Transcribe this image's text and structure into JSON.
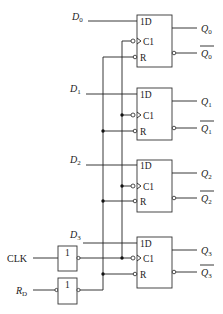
{
  "diagram": {
    "type": "circuit",
    "flipflops": [
      {
        "id": "FF0",
        "d_label": "D",
        "d_sub": "0",
        "q_label": "Q",
        "q_sub": "0",
        "qn_label": "Q",
        "qn_sub": "0",
        "pins": {
          "d": "1D",
          "clk": "C1",
          "reset": "R"
        }
      },
      {
        "id": "FF1",
        "d_label": "D",
        "d_sub": "1",
        "q_label": "Q",
        "q_sub": "1",
        "qn_label": "Q",
        "qn_sub": "1",
        "pins": {
          "d": "1D",
          "clk": "C1",
          "reset": "R"
        }
      },
      {
        "id": "FF2",
        "d_label": "D",
        "d_sub": "2",
        "q_label": "Q",
        "q_sub": "2",
        "qn_label": "Q",
        "qn_sub": "2",
        "pins": {
          "d": "1D",
          "clk": "C1",
          "reset": "R"
        }
      },
      {
        "id": "FF3",
        "d_label": "D",
        "d_sub": "3",
        "q_label": "Q",
        "q_sub": "3",
        "qn_label": "Q",
        "qn_sub": "3",
        "pins": {
          "d": "1D",
          "clk": "C1",
          "reset": "R"
        }
      }
    ],
    "gates": [
      {
        "id": "clk-inverter",
        "label": "1",
        "input": "CLK"
      },
      {
        "id": "reset-inverter",
        "label": "1",
        "input_main": "R",
        "input_sub": "D"
      }
    ],
    "inputs": {
      "clk": "CLK",
      "reset_main": "R",
      "reset_sub": "D"
    }
  }
}
